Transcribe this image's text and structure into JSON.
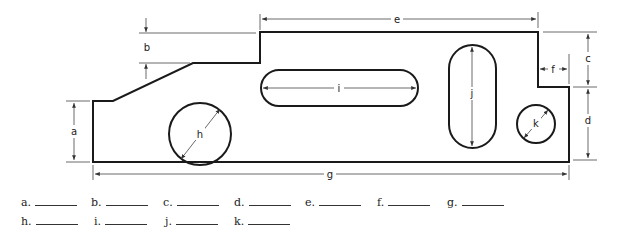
{
  "figure": {
    "type": "mechanical-part-dimension-drawing",
    "dimensions": [
      {
        "id": "a",
        "label": "a",
        "description": "height of left edge"
      },
      {
        "id": "b",
        "label": "b",
        "description": "step height from mid-level to top"
      },
      {
        "id": "c",
        "label": "c",
        "description": "depth of right notch"
      },
      {
        "id": "d",
        "label": "d",
        "description": "height of right edge below notch"
      },
      {
        "id": "e",
        "label": "e",
        "description": "width of top edge"
      },
      {
        "id": "f",
        "label": "f",
        "description": "width of right notch"
      },
      {
        "id": "g",
        "label": "g",
        "description": "overall width"
      },
      {
        "id": "h",
        "label": "h",
        "description": "diameter of large hole"
      },
      {
        "id": "i",
        "label": "i",
        "description": "length of horizontal slot"
      },
      {
        "id": "j",
        "label": "j",
        "description": "length of vertical slot"
      },
      {
        "id": "k",
        "label": "k",
        "description": "diameter of small hole"
      }
    ],
    "colors": {
      "line": "#1a1a1a",
      "dim_line": "#444444",
      "background": "#ffffff"
    }
  },
  "answers": {
    "row1": [
      {
        "label": "a."
      },
      {
        "label": "b."
      },
      {
        "label": "c."
      },
      {
        "label": "d."
      },
      {
        "label": "e."
      },
      {
        "label": "f."
      },
      {
        "label": "g."
      }
    ],
    "row2": [
      {
        "label": "h."
      },
      {
        "label": "i."
      },
      {
        "label": "j."
      },
      {
        "label": "k."
      }
    ]
  }
}
